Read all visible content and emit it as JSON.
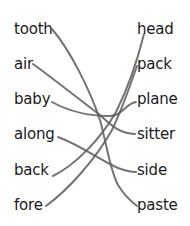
{
  "left_words": [
    "tooth",
    "air",
    "baby",
    "along",
    "back",
    "fore"
  ],
  "right_words": [
    "head",
    "pack",
    "plane",
    "sitter",
    "side",
    "paste"
  ],
  "matches": [
    {
      "left": "tooth",
      "right": "paste"
    },
    {
      "left": "air",
      "right": "sitter"
    },
    {
      "left": "baby",
      "right": "plane"
    },
    {
      "left": "along",
      "right": "side"
    },
    {
      "left": "back",
      "right": "head"
    },
    {
      "left": "fore",
      "right": "pack"
    }
  ],
  "line_color": "#5a5a5a"
}
